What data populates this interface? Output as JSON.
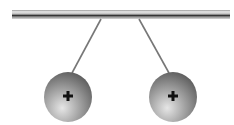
{
  "diagram": {
    "rod": {
      "x1": 12,
      "x2": 230,
      "y": 10,
      "height": 9
    },
    "spheres": [
      {
        "id": "left",
        "cx": 68,
        "cy": 97,
        "r": 24,
        "charge": "+",
        "thread_top": [
          101,
          19
        ],
        "thread_bottom": [
          72,
          73
        ]
      },
      {
        "id": "right",
        "cx": 173,
        "cy": 97,
        "r": 24,
        "charge": "+",
        "thread_top": [
          139,
          19
        ],
        "thread_bottom": [
          169,
          73
        ]
      }
    ],
    "colors": {
      "sphere_light": "#e0e0e0",
      "sphere_dark": "#6a6a6a",
      "thread": "#777777",
      "rod_dark": "#3a3a3a",
      "rod_light": "#cfcfcf"
    }
  }
}
